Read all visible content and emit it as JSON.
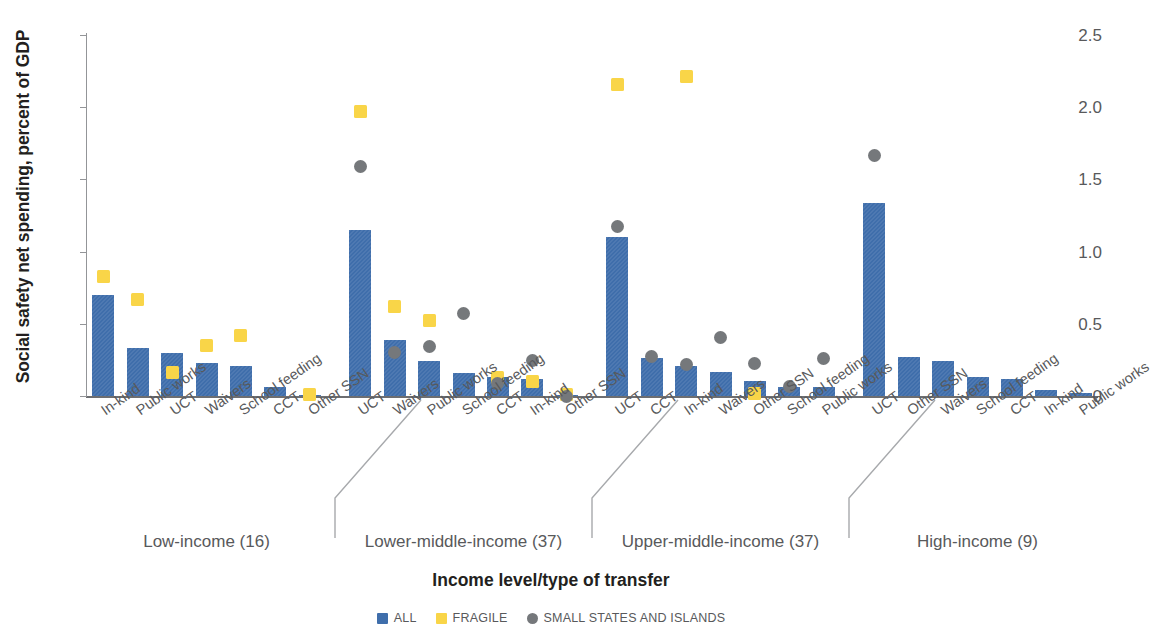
{
  "chart_data": {
    "type": "bar",
    "title": "",
    "xlabel": "Income level/type of transfer",
    "ylabel": "Social safety net spending, percent of GDP",
    "ylim": [
      0,
      2.5
    ],
    "yticks": [
      "0",
      "0.5",
      "1.0",
      "1.5",
      "2.0",
      "2.5"
    ],
    "ytick_values": [
      0,
      0.5,
      1.0,
      1.5,
      2.0,
      2.5
    ],
    "grid": false,
    "legend_position": "bottom-center",
    "legend": [
      {
        "name": "ALL",
        "marker": "square",
        "color": "#3f6eab"
      },
      {
        "name": "FRAGILE",
        "marker": "square",
        "color": "#f9d548"
      },
      {
        "name": "SMALL STATES AND ISLANDS",
        "marker": "circle",
        "color": "#75787b"
      }
    ],
    "series": [
      {
        "name": "ALL",
        "color": "#3f6eab",
        "marker": "bar"
      },
      {
        "name": "FRAGILE",
        "color": "#f9d548",
        "marker": "square"
      },
      {
        "name": "SMALL STATES AND ISLANDS",
        "color": "#75787b",
        "marker": "circle"
      }
    ],
    "groups": [
      {
        "label": "Low-income (16)",
        "categories": [
          "In-kind",
          "Public works",
          "UCT",
          "Waivers",
          "School feeding",
          "CCT",
          "Other SSN"
        ],
        "all": [
          0.7,
          0.33,
          0.3,
          0.23,
          0.21,
          0.06,
          0.01
        ],
        "fragile": [
          0.83,
          0.67,
          0.16,
          0.35,
          0.42,
          null,
          0.01
        ],
        "small": [
          null,
          null,
          null,
          null,
          null,
          null,
          null
        ]
      },
      {
        "label": "Lower-middle-income (37)",
        "categories": [
          "UCT",
          "Waivers",
          "Public works",
          "School feeding",
          "CCT",
          "In-kind",
          "Other SSN"
        ],
        "all": [
          1.15,
          0.385,
          0.24,
          0.16,
          0.135,
          0.12,
          0.005
        ],
        "fragile": [
          1.97,
          0.62,
          0.52,
          null,
          0.13,
          0.1,
          0.01
        ],
        "small": [
          1.59,
          0.3,
          0.345,
          0.57,
          0.09,
          0.245,
          0.0
        ]
      },
      {
        "label": "Upper-middle-income (37)",
        "categories": [
          "UCT",
          "CCT",
          "In-kind",
          "Waivers",
          "Other SSN",
          "School feeding",
          "Public works"
        ],
        "all": [
          1.1,
          0.265,
          0.205,
          0.165,
          0.105,
          0.06,
          0.065
        ],
        "fragile": [
          2.16,
          null,
          2.21,
          null,
          0.02,
          null,
          null
        ],
        "small": [
          1.175,
          0.275,
          0.215,
          0.405,
          0.225,
          0.065,
          0.26
        ]
      },
      {
        "label": "High-income (9)",
        "categories": [
          "UCT",
          "Other SSN",
          "Waivers",
          "School feeding",
          "CCT",
          "In-kind",
          "Public works"
        ],
        "all": [
          1.335,
          0.27,
          0.24,
          0.135,
          0.12,
          0.04,
          0.02
        ],
        "fragile": [
          null,
          null,
          null,
          null,
          null,
          null,
          null
        ],
        "small": [
          1.665,
          null,
          null,
          null,
          null,
          null,
          null
        ]
      }
    ]
  }
}
